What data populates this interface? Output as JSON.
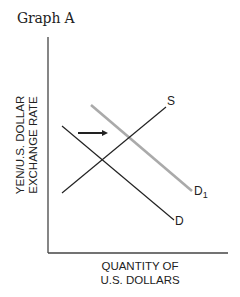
{
  "title": "Graph A",
  "axes": {
    "y_label_line1": "YEN/U.S. DOLLAR",
    "y_label_line2": "EXCHANGE RATE",
    "x_label_line1": "QUANTITY OF",
    "x_label_line2": "U.S. DOLLARS"
  },
  "curves": {
    "supply": {
      "label": "S",
      "color": "#222222"
    },
    "demand": {
      "label": "D",
      "color": "#222222"
    },
    "new_demand": {
      "label": "D",
      "subscript": "1",
      "color": "#aaaaaa"
    }
  },
  "annotation": {
    "type": "arrow",
    "direction": "right",
    "meaning": "demand shift from D to D1"
  }
}
